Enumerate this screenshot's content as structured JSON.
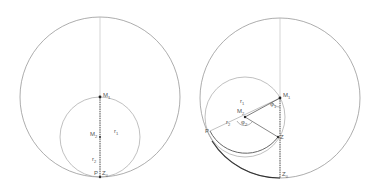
{
  "left_figure": {
    "labels": {
      "M1": "M",
      "M1_sub": "1",
      "M2": "M",
      "M2_sub": "2",
      "r1": "r",
      "r1_sub": "1",
      "r2": "r",
      "r2_sub": "2",
      "P": "P",
      "Z0": "Z",
      "Z0_sub": "0"
    }
  },
  "right_figure": {
    "labels": {
      "M1": "M",
      "M1_sub": "1",
      "M2": "M",
      "M2_sub": "2",
      "r1": "r",
      "r1_sub": "1",
      "r2": "r",
      "r2_sub": "2",
      "phi1": "φ",
      "phi1_sub": "1",
      "phi2": "φ",
      "phi2_sub": "2",
      "P": "P",
      "Z": "Z",
      "Z0": "Z",
      "Z0_sub": "0"
    }
  },
  "colors": {
    "outer_circle": "#888888",
    "inner_circle": "#a0a0a0",
    "axis_line": "#bbbbbb",
    "dark_line": "#333333"
  }
}
